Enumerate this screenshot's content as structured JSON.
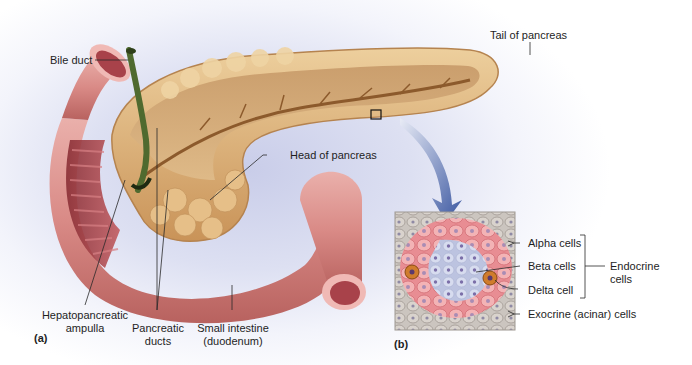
{
  "figure": {
    "panel_a": {
      "letter": "(a)",
      "labels": {
        "bile_duct": "Bile duct",
        "tail_of_pancreas": "Tail of pancreas",
        "head_of_pancreas": "Head of pancreas",
        "hepatopancreatic_ampulla_line1": "Hepatopancreatic",
        "hepatopancreatic_ampulla_line2": "ampulla",
        "pancreatic_ducts_line1": "Pancreatic",
        "pancreatic_ducts_line2": "ducts",
        "small_intestine_line1": "Small intestine",
        "small_intestine_line2": "(duodenum)"
      }
    },
    "panel_b": {
      "letter": "(b)",
      "labels": {
        "alpha_cells": "Alpha cells",
        "beta_cells": "Beta cells",
        "delta_cell": "Delta cell",
        "endocrine_cells_line1": "Endocrine",
        "endocrine_cells_line2": "cells",
        "exocrine_cells": "Exocrine (acinar) cells"
      }
    },
    "colors": {
      "pancreas": "#d9a870",
      "pancreas_dark": "#a9743f",
      "duodenum": "#d98a8a",
      "duodenum_inner": "#a8424a",
      "bile_duct": "#4f6a2f",
      "arrow": "#3a56a0",
      "islet_pink": "#f0a5a8",
      "islet_blue": "#c9cfe8",
      "exocrine_gray": "#b9b3ad",
      "delta_orange": "#d07c2c"
    }
  }
}
